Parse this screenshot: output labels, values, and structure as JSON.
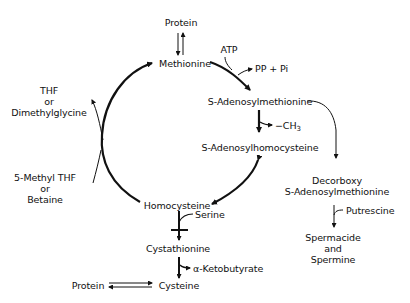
{
  "diagram": {
    "nodes": {
      "protein_top": "Protein",
      "methionine": "Methionine",
      "atp": "ATP",
      "pp_pi": "PP + Pi",
      "sam": "S-Adenosylmethionine",
      "ch3": "−CH",
      "ch3_sub": "3",
      "sah": "S-Adenosylhomocysteine",
      "thf_line1": "THF",
      "thf_line2": "or",
      "thf_line3": "Dimethylglycine",
      "methylthf_line1": "5-Methyl THF",
      "methylthf_line2": "or",
      "methylthf_line3": "Betaine",
      "homocysteine": "Homocysteine",
      "serine": "Serine",
      "cystathionine": "Cystathionine",
      "ketobutyrate": "α-Ketobutyrate",
      "cysteine": "Cysteine",
      "protein_bottom": "Protein",
      "dcsam_line1": "Decorboxy",
      "dcsam_line2": "S-Adenosylmethionine",
      "putrescine": "Putrescine",
      "spermidine_line1": "Spermacide",
      "spermidine_line2": "and",
      "spermidine_line3": "Spermine"
    },
    "edges": [
      {
        "from": "Protein",
        "to": "Methionine",
        "type": "reversible"
      },
      {
        "from": "Methionine",
        "to": "S-Adenosylmethionine",
        "cofactor_in": "ATP",
        "product_out": "PP + Pi"
      },
      {
        "from": "S-Adenosylmethionine",
        "to": "S-Adenosylhomocysteine",
        "product_out": "−CH3"
      },
      {
        "from": "S-Adenosylhomocysteine",
        "to": "Homocysteine",
        "type": "reversible"
      },
      {
        "from": "Homocysteine",
        "to": "Methionine",
        "cofactor_in": "5-Methyl THF or Betaine",
        "product_out": "THF or Dimethylglycine"
      },
      {
        "from": "Homocysteine",
        "to": "Cystathionine",
        "cofactor_in": "Serine"
      },
      {
        "from": "Cystathionine",
        "to": "Cysteine",
        "product_out": "α-Ketobutyrate"
      },
      {
        "from": "Protein",
        "to": "Cysteine",
        "type": "reversible"
      },
      {
        "from": "S-Adenosylmethionine",
        "to": "Decorboxy S-Adenosylmethionine"
      },
      {
        "from": "Decorboxy S-Adenosylmethionine",
        "to": "Spermacide and Spermine",
        "cofactor_in": "Putrescine"
      }
    ],
    "colors": {
      "ink": "#111111",
      "background": "#ffffff"
    }
  }
}
